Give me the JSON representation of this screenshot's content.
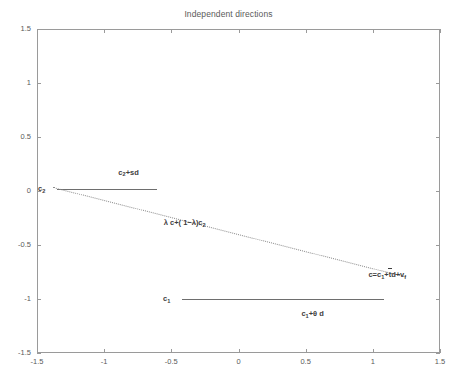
{
  "chart_data": {
    "type": "line",
    "title": "Independent directions",
    "xlabel": "",
    "ylabel": "",
    "xlim": [
      -1.5,
      1.5
    ],
    "ylim": [
      -1.5,
      1.5
    ],
    "grid": false,
    "legend": "none",
    "xticks": [
      "-1.5",
      "-1",
      "-0.5",
      "0",
      "0.5",
      "1",
      "1.5"
    ],
    "xtick_values": [
      -1.5,
      -1,
      -0.5,
      0,
      0.5,
      1,
      1.5
    ],
    "yticks": [
      "1.5",
      "1",
      "0.5",
      "0",
      "-0.5",
      "-1",
      "-1.5"
    ],
    "ytick_values": [
      1.5,
      1,
      0.5,
      0,
      -0.5,
      -1,
      -1.5
    ],
    "series": [
      {
        "name": "c2 ray",
        "style": "solid",
        "color": "#6e6e6e",
        "x": [
          -1.35,
          -0.61
        ],
        "y": [
          0.02,
          0.02
        ]
      },
      {
        "name": "c1 ray",
        "style": "solid",
        "color": "#6e6e6e",
        "x": [
          -0.42,
          1.08
        ],
        "y": [
          -1.0,
          -1.0
        ]
      },
      {
        "name": "lambda combination",
        "style": "dotted",
        "color": "#8d8d8d",
        "x": [
          -1.38,
          1.25
        ],
        "y": [
          0.04,
          -0.79
        ]
      }
    ],
    "annotations": [
      {
        "id": "c2-point-label",
        "text_html": "c<sub>2</sub>",
        "text": "c2",
        "x": -1.44,
        "y": 0.02
      },
      {
        "id": "c2-plus-sd",
        "text_html": "c<sub>2</sub>+sd",
        "text": "c2+sd",
        "x": -0.82,
        "y": 0.17
      },
      {
        "id": "lambda-combo",
        "text_html": "&#955; c+( 1&#8722;&#955;)c<sub>2</sub>",
        "text": "λ c+(1−λ)c2",
        "x": -0.4,
        "y": -0.3
      },
      {
        "id": "c-definition",
        "text_html": "c=c<sub>1</sub>+<span class=\"ovr\">t<span class=\"bar\"></span></span>d+v<sub>f</sub>",
        "text": "c=c1+td+vf",
        "x": 1.25,
        "y": -0.78
      },
      {
        "id": "c1-point-label",
        "text_html": "c<sub>1</sub>",
        "text": "c1",
        "x": -0.51,
        "y": -1.0
      },
      {
        "id": "c1-plus-theta-d",
        "text_html": "c<sub>1</sub>+&#952; d",
        "text": "c1+θ d",
        "x": 0.55,
        "y": -1.14
      }
    ]
  },
  "figure": {
    "caption": "",
    "background": "#ffffff",
    "axis_color": "#9a9a9a",
    "text_color": "#5a5a5a"
  }
}
